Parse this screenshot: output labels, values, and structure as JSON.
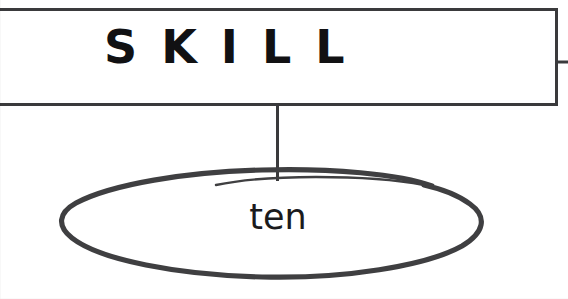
{
  "diagram": {
    "title_box": {
      "label": "SKILL",
      "border_color": "#3a3a3c",
      "fill_color": "#ffffff",
      "text_color": "#111113"
    },
    "connectors": [
      {
        "name": "right-edge-stub",
        "orientation": "horizontal",
        "color": "#3a3a3c"
      },
      {
        "name": "box-to-ellipse",
        "orientation": "vertical",
        "color": "#3a3a3c"
      }
    ],
    "node": {
      "label": "ten",
      "shape": "ellipse",
      "stroke_color": "#3f3f41",
      "fill_color": "#ffffff",
      "text_color": "#1b1b1d"
    },
    "background_color": "#ffffff"
  }
}
